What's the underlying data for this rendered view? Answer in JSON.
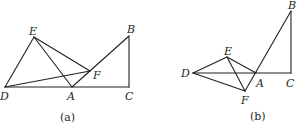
{
  "figures": [
    {
      "id": "a",
      "caption": "(a)",
      "points": {
        "E": {
          "label": "E",
          "x": 34,
          "y": 37
        },
        "B": {
          "label": "B",
          "x": 129,
          "y": 36
        },
        "F": {
          "label": "F",
          "x": 90,
          "y": 71
        },
        "D": {
          "label": "D",
          "x": 5,
          "y": 87
        },
        "A": {
          "label": "A",
          "x": 72,
          "y": 87
        },
        "C": {
          "label": "C",
          "x": 129,
          "y": 87
        }
      },
      "segments": [
        [
          "D",
          "C"
        ],
        [
          "D",
          "E"
        ],
        [
          "E",
          "A"
        ],
        [
          "E",
          "F"
        ],
        [
          "D",
          "F"
        ],
        [
          "A",
          "B"
        ],
        [
          "B",
          "C"
        ]
      ]
    },
    {
      "id": "b",
      "caption": "(b)",
      "points": {
        "B": {
          "label": "B",
          "x": 291,
          "y": 11
        },
        "E": {
          "label": "E",
          "x": 227,
          "y": 57
        },
        "D": {
          "label": "D",
          "x": 193,
          "y": 73
        },
        "A": {
          "label": "A",
          "x": 256,
          "y": 73
        },
        "C": {
          "label": "C",
          "x": 291,
          "y": 73
        },
        "F": {
          "label": "F",
          "x": 245,
          "y": 91
        }
      },
      "segments": [
        [
          "D",
          "C"
        ],
        [
          "D",
          "E"
        ],
        [
          "D",
          "F"
        ],
        [
          "E",
          "A"
        ],
        [
          "E",
          "F"
        ],
        [
          "F",
          "B"
        ],
        [
          "B",
          "C"
        ]
      ]
    }
  ]
}
